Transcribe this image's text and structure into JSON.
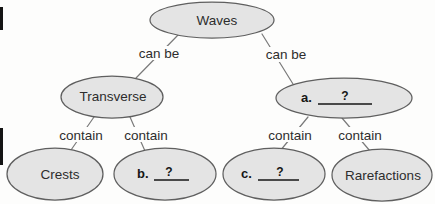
{
  "colors": {
    "background": "#fdfdfc",
    "node_fill": "#e4e4e4",
    "node_stroke": "#5f5f5f",
    "edge_line": "#7a7a7a",
    "text": "#2d2d2d",
    "blank": "#161616"
  },
  "nodes": {
    "waves": {
      "label": "Waves"
    },
    "transverse": {
      "label": "Transverse"
    },
    "a": {
      "prefix": "a.",
      "blank": "?"
    },
    "crests": {
      "label": "Crests"
    },
    "b": {
      "prefix": "b.",
      "blank": "?"
    },
    "c": {
      "prefix": "c.",
      "blank": "?"
    },
    "rarefactions": {
      "label": "Rarefactions"
    }
  },
  "edges": {
    "waves_transverse": {
      "label": "can be"
    },
    "waves_a": {
      "label": "can be"
    },
    "transverse_crests": {
      "label": "contain"
    },
    "transverse_b": {
      "label": "contain"
    },
    "a_c": {
      "label": "contain"
    },
    "a_rarefactions": {
      "label": "contain"
    }
  }
}
